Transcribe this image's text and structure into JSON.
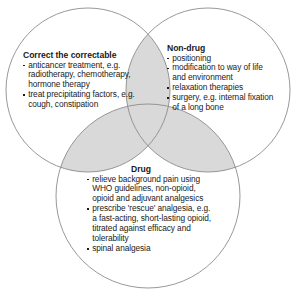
{
  "diagram": {
    "type": "venn-3-circle",
    "title_visible": false,
    "colors": {
      "circle_stroke": "#8c8c8c",
      "overlap_fill": "#d9d9d9",
      "overlap_stroke": "#8c8c8c",
      "background": "#ffffff",
      "text": "#1a1a1a"
    },
    "circles": [
      {
        "name": "correct-the-correctable",
        "cx": 88,
        "cy": 90,
        "r": 82
      },
      {
        "name": "non-drug",
        "cx": 208,
        "cy": 90,
        "r": 82
      },
      {
        "name": "drug",
        "cx": 148,
        "cy": 196,
        "r": 92
      }
    ]
  },
  "groups": {
    "correct": {
      "title": "Correct the correctable",
      "bullets": [
        "anticancer treatment, e.g.",
        "radiotherapy, chemotherapy,",
        "hormone therapy",
        "treat precipitating factors, e.g.",
        "cough, constipation"
      ],
      "bullet_flags": [
        true,
        false,
        false,
        true,
        false
      ]
    },
    "nondrug": {
      "title": "Non-drug",
      "bullets": [
        "positioning",
        "modification to way of life",
        "and environment",
        "relaxation therapies",
        "surgery, e.g. internal fixation",
        "of a long bone"
      ],
      "bullet_flags": [
        true,
        true,
        false,
        true,
        true,
        false
      ]
    },
    "drug": {
      "title": "Drug",
      "bullets": [
        "relieve background pain using",
        "WHO guidelines, non-opioid,",
        "opioid and adjuvant analgesics",
        "prescribe 'rescue' analgesia, e.g.",
        "a fast-acting, short-lasting opioid,",
        "titrated against efficacy and",
        "tolerability",
        "spinal analgesia"
      ],
      "bullet_flags": [
        true,
        false,
        false,
        true,
        false,
        false,
        false,
        true
      ]
    }
  }
}
